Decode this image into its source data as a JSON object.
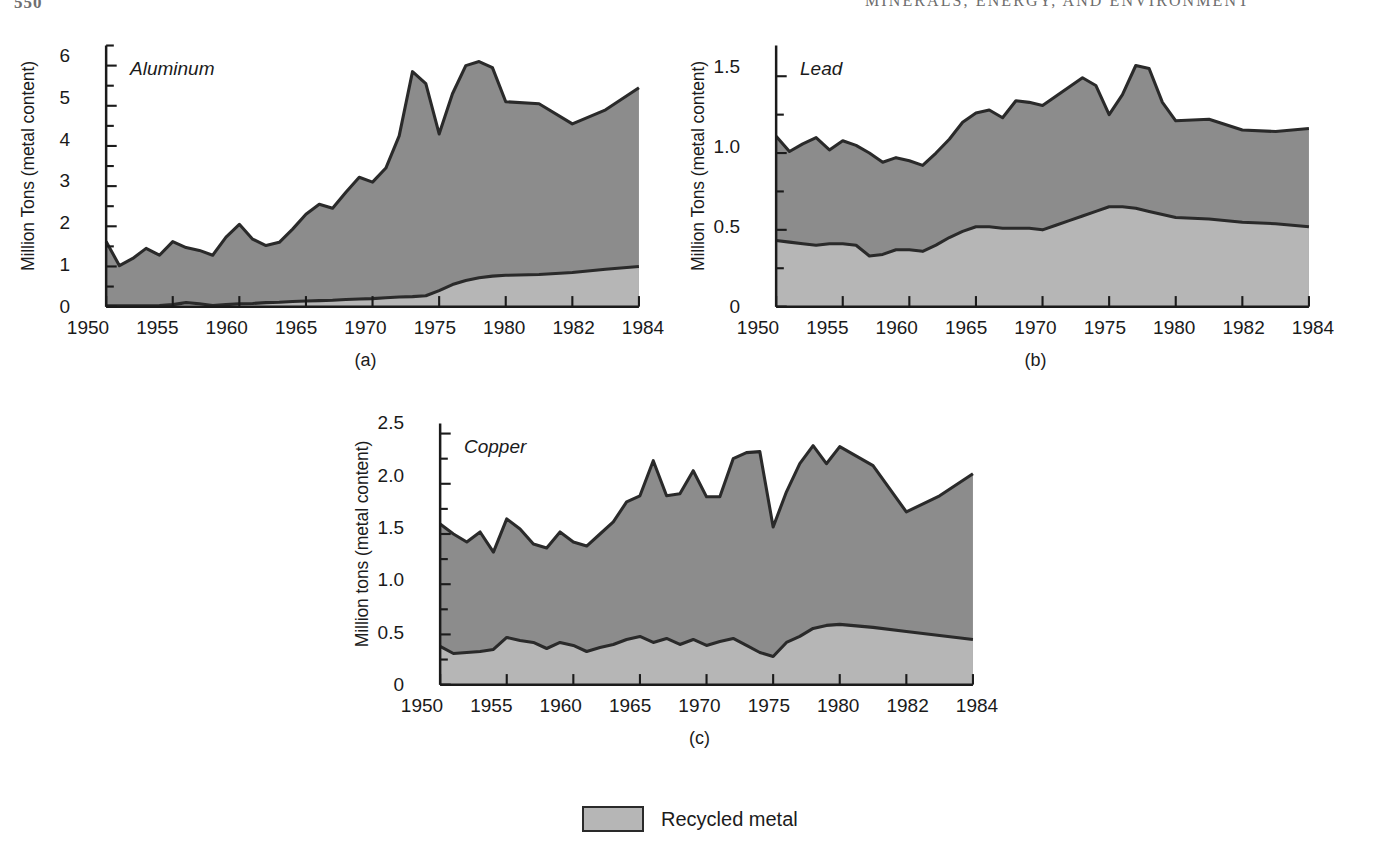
{
  "page": {
    "number": "550",
    "running_head": "MINERALS, ENERGY, AND ENVIRONMENT"
  },
  "legend": {
    "label": "Recycled metal",
    "swatch_color": "#b6b6b6"
  },
  "colors": {
    "total_fill": "#8c8c8c",
    "recycled_fill": "#b6b6b6",
    "line": "#2a2a2a",
    "axis": "#1b1b1b"
  },
  "panels": [
    {
      "id": "a",
      "caption": "(a)",
      "series_title": "Aluminum",
      "ylabel": "Million Tons (metal content)",
      "yticks": [
        "0",
        "1",
        "2",
        "3",
        "4",
        "5",
        "6"
      ],
      "xticks": [
        "1950",
        "1955",
        "1960",
        "1965",
        "1970",
        "1975",
        "1980",
        "1982",
        "1984"
      ]
    },
    {
      "id": "b",
      "caption": "(b)",
      "series_title": "Lead",
      "ylabel": "Million Tons (metal content)",
      "yticks": [
        "0",
        "0.5",
        "1.0",
        "1.5"
      ],
      "xticks": [
        "1950",
        "1955",
        "1960",
        "1965",
        "1970",
        "1975",
        "1980",
        "1982",
        "1984"
      ]
    },
    {
      "id": "c",
      "caption": "(c)",
      "series_title": "Copper",
      "ylabel": "Million tons (metal content)",
      "yticks": [
        "0",
        "0.5",
        "1.0",
        "1.5",
        "2.0",
        "2.5"
      ],
      "xticks": [
        "1950",
        "1955",
        "1960",
        "1965",
        "1970",
        "1975",
        "1980",
        "1982",
        "1984"
      ]
    }
  ],
  "chart_data": [
    {
      "type": "area",
      "id": "a",
      "title": "Aluminum",
      "xlabel": "",
      "ylabel": "Million Tons (metal content)",
      "ylim": [
        0,
        6.5
      ],
      "ytick_values": [
        0,
        1,
        2,
        3,
        4,
        5,
        6
      ],
      "minor_ytick_step": 0.5,
      "grid": false,
      "legend_position": "below-figure",
      "x": [
        1950,
        1951,
        1952,
        1953,
        1954,
        1955,
        1956,
        1957,
        1958,
        1959,
        1960,
        1961,
        1962,
        1963,
        1964,
        1965,
        1966,
        1967,
        1968,
        1969,
        1970,
        1971,
        1972,
        1973,
        1974,
        1975,
        1976,
        1977,
        1978,
        1979,
        1980,
        1981,
        1982,
        1983,
        1984
      ],
      "series": [
        {
          "name": "Total consumption (metal content)",
          "values": [
            1.62,
            1.02,
            1.2,
            1.45,
            1.28,
            1.62,
            1.47,
            1.4,
            1.28,
            1.73,
            2.05,
            1.68,
            1.52,
            1.6,
            1.93,
            2.3,
            2.55,
            2.45,
            2.85,
            3.22,
            3.1,
            3.45,
            4.25,
            5.85,
            5.55,
            4.3,
            5.3,
            6.0,
            6.1,
            5.95,
            5.1,
            5.05,
            4.55,
            4.9,
            5.45
          ],
          "stacking": "top-of-stack",
          "fill": "#8c8c8c"
        },
        {
          "name": "Recycled metal",
          "values": [
            0.02,
            0.02,
            0.02,
            0.02,
            0.03,
            0.05,
            0.1,
            0.07,
            0.03,
            0.05,
            0.07,
            0.08,
            0.1,
            0.11,
            0.13,
            0.14,
            0.15,
            0.16,
            0.18,
            0.19,
            0.2,
            0.22,
            0.24,
            0.25,
            0.27,
            0.4,
            0.55,
            0.65,
            0.72,
            0.76,
            0.78,
            0.8,
            0.85,
            0.93,
            1.0
          ],
          "stacking": "bottom-of-stack",
          "fill": "#b6b6b6"
        }
      ]
    },
    {
      "type": "area",
      "id": "b",
      "title": "Lead",
      "xlabel": "",
      "ylabel": "Million Tons (metal content)",
      "ylim": [
        0,
        1.7
      ],
      "ytick_values": [
        0,
        0.5,
        1.0,
        1.5
      ],
      "minor_ytick_step": 0.25,
      "grid": false,
      "legend_position": "below-figure",
      "x": [
        1950,
        1951,
        1952,
        1953,
        1954,
        1955,
        1956,
        1957,
        1958,
        1959,
        1960,
        1961,
        1962,
        1963,
        1964,
        1965,
        1966,
        1967,
        1968,
        1969,
        1970,
        1971,
        1972,
        1973,
        1974,
        1975,
        1976,
        1977,
        1978,
        1979,
        1980,
        1981,
        1982,
        1983,
        1984
      ],
      "series": [
        {
          "name": "Total consumption (metal content)",
          "values": [
            1.11,
            1.01,
            1.06,
            1.1,
            1.02,
            1.08,
            1.05,
            1.0,
            0.94,
            0.97,
            0.95,
            0.92,
            1.0,
            1.09,
            1.2,
            1.26,
            1.28,
            1.23,
            1.34,
            1.33,
            1.31,
            1.37,
            1.43,
            1.49,
            1.44,
            1.25,
            1.38,
            1.57,
            1.55,
            1.33,
            1.21,
            1.22,
            1.15,
            1.14,
            1.16
          ],
          "stacking": "top-of-stack",
          "fill": "#8c8c8c"
        },
        {
          "name": "Recycled metal",
          "values": [
            0.43,
            0.42,
            0.41,
            0.4,
            0.41,
            0.41,
            0.4,
            0.33,
            0.34,
            0.37,
            0.37,
            0.36,
            0.4,
            0.45,
            0.49,
            0.52,
            0.52,
            0.51,
            0.51,
            0.51,
            0.5,
            0.53,
            0.56,
            0.59,
            0.62,
            0.65,
            0.65,
            0.64,
            0.62,
            0.6,
            0.58,
            0.57,
            0.55,
            0.54,
            0.52
          ],
          "stacking": "bottom-of-stack",
          "fill": "#b6b6b6"
        }
      ]
    },
    {
      "type": "area",
      "id": "c",
      "title": "Copper",
      "xlabel": "",
      "ylabel": "Million tons (metal content)",
      "ylim": [
        0,
        2.6
      ],
      "ytick_values": [
        0,
        0.5,
        1.0,
        1.5,
        2.0,
        2.5
      ],
      "minor_ytick_step": 0.25,
      "grid": false,
      "legend_position": "below-figure",
      "x": [
        1950,
        1951,
        1952,
        1953,
        1954,
        1955,
        1956,
        1957,
        1958,
        1959,
        1960,
        1961,
        1962,
        1963,
        1964,
        1965,
        1966,
        1967,
        1968,
        1969,
        1970,
        1971,
        1972,
        1973,
        1974,
        1975,
        1976,
        1977,
        1978,
        1979,
        1980,
        1981,
        1982,
        1983,
        1984
      ],
      "series": [
        {
          "name": "Total consumption (metal content)",
          "values": [
            1.6,
            1.5,
            1.42,
            1.52,
            1.32,
            1.65,
            1.55,
            1.4,
            1.36,
            1.52,
            1.42,
            1.38,
            1.5,
            1.62,
            1.82,
            1.88,
            2.23,
            1.88,
            1.9,
            2.13,
            1.87,
            1.87,
            2.25,
            2.31,
            2.32,
            1.57,
            1.92,
            2.2,
            2.38,
            2.2,
            2.37,
            2.18,
            1.72,
            1.88,
            2.1
          ],
          "stacking": "top-of-stack",
          "fill": "#8c8c8c"
        },
        {
          "name": "Recycled metal",
          "values": [
            0.38,
            0.31,
            0.32,
            0.33,
            0.35,
            0.47,
            0.44,
            0.42,
            0.36,
            0.42,
            0.39,
            0.33,
            0.37,
            0.4,
            0.45,
            0.48,
            0.42,
            0.46,
            0.4,
            0.45,
            0.39,
            0.43,
            0.46,
            0.39,
            0.32,
            0.28,
            0.42,
            0.48,
            0.56,
            0.59,
            0.6,
            0.57,
            0.53,
            0.49,
            0.45
          ],
          "stacking": "bottom-of-stack",
          "fill": "#b6b6b6"
        }
      ]
    }
  ]
}
